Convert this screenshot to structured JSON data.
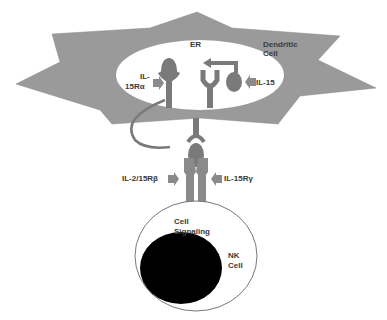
{
  "diagram": {
    "colors": {
      "dendritic_cell_fill": "#9a9a9a",
      "er_fill": "#ffffff",
      "protein_fill": "#7a7a7a",
      "arrow_fill": "#8a8a8a",
      "nucleus_fill": "#000000",
      "nk_cell_stroke": "#555555"
    },
    "labels": {
      "er": "ER",
      "dendritic_cell_line1": "Dendritic",
      "dendritic_cell_line2": "Cell",
      "il15ra_line1": "IL-",
      "il15ra_line2": "15Rα",
      "il15": "IL-15",
      "il2_15rb": "IL-2/15Rβ",
      "il15rg": "IL-15Rγ",
      "cell_signaling_line1": "Cell",
      "cell_signaling_line2": "Signaling",
      "nk_cell_line1": "NK",
      "nk_cell_line2": "Cell"
    }
  }
}
